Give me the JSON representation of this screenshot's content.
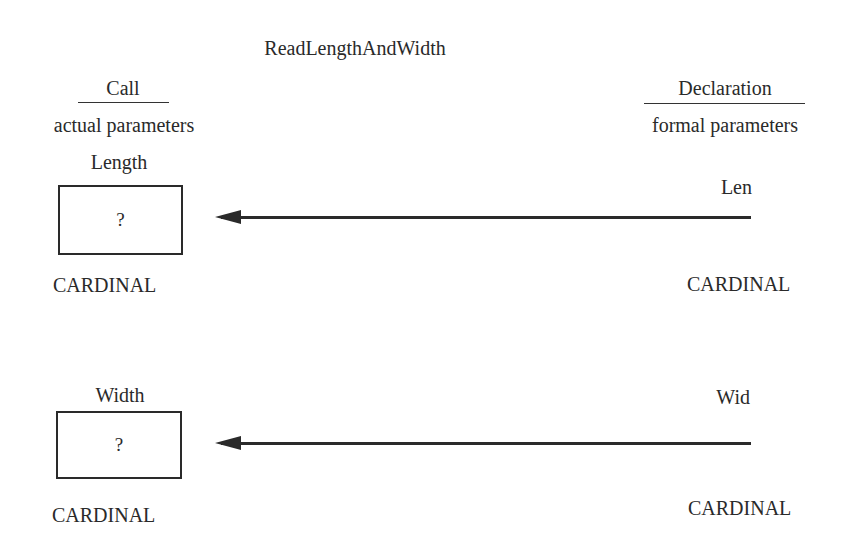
{
  "title": "ReadLengthAndWidth",
  "call_side": {
    "heading": "Call",
    "subheading": "actual parameters",
    "params": [
      {
        "name": "Length",
        "value": "?",
        "type": "CARDINAL"
      },
      {
        "name": "Width",
        "value": "?",
        "type": "CARDINAL"
      }
    ]
  },
  "declaration_side": {
    "heading": "Declaration",
    "subheading": "formal parameters",
    "params": [
      {
        "name": "Len",
        "type": "CARDINAL"
      },
      {
        "name": "Wid",
        "type": "CARDINAL"
      }
    ]
  },
  "arrows": [
    {
      "from": "Len",
      "to": "Length",
      "direction": "right-to-left"
    },
    {
      "from": "Wid",
      "to": "Width",
      "direction": "right-to-left"
    }
  ]
}
